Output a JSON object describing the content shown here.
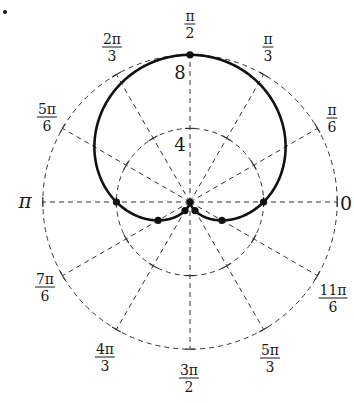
{
  "chart_data": {
    "type": "polar",
    "title": "",
    "equation": "r = 4 + 4 sin θ",
    "curve": "cardioid",
    "radial_ticks": [
      4,
      8
    ],
    "radial_tick_labels": [
      "4",
      "8"
    ],
    "rlim": [
      0,
      8
    ],
    "grid": true,
    "grid_style": "dashed",
    "angle_labels": [
      {
        "angle_deg": 0,
        "num": "0",
        "den": ""
      },
      {
        "angle_deg": 30,
        "num": "π",
        "den": "6"
      },
      {
        "angle_deg": 60,
        "num": "π",
        "den": "3"
      },
      {
        "angle_deg": 90,
        "num": "π",
        "den": "2"
      },
      {
        "angle_deg": 120,
        "num": "2π",
        "den": "3"
      },
      {
        "angle_deg": 150,
        "num": "5π",
        "den": "6"
      },
      {
        "angle_deg": 180,
        "num": "π",
        "den": ""
      },
      {
        "angle_deg": 210,
        "num": "7π",
        "den": "6"
      },
      {
        "angle_deg": 240,
        "num": "4π",
        "den": "3"
      },
      {
        "angle_deg": 270,
        "num": "3π",
        "den": "2"
      },
      {
        "angle_deg": 300,
        "num": "5π",
        "den": "3"
      },
      {
        "angle_deg": 330,
        "num": "11π",
        "den": "6"
      }
    ],
    "marked_points": [
      {
        "theta": "0",
        "r": 4
      },
      {
        "theta": "π/2",
        "r": 8
      },
      {
        "theta": "π",
        "r": 4
      },
      {
        "theta": "7π/6",
        "r": 2
      },
      {
        "theta": "4π/3",
        "r": 0.54
      },
      {
        "theta": "3π/2",
        "r": 0
      },
      {
        "theta": "5π/3",
        "r": 0.54
      },
      {
        "theta": "11π/6",
        "r": 2
      }
    ],
    "colors": {
      "curve": "#111111",
      "grid": "#333333",
      "text": "#1a1a1a"
    }
  },
  "labels": {
    "r4": "4",
    "r8": "8",
    "pi": "π",
    "zero": "0",
    "a30": {
      "num": "π",
      "den": "6"
    },
    "a60": {
      "num": "π",
      "den": "3"
    },
    "a90": {
      "num": "π",
      "den": "2"
    },
    "a120": {
      "num": "2π",
      "den": "3"
    },
    "a150": {
      "num": "5π",
      "den": "6"
    },
    "a210": {
      "num": "7π",
      "den": "6"
    },
    "a240": {
      "num": "4π",
      "den": "3"
    },
    "a270": {
      "num": "3π",
      "den": "2"
    },
    "a300": {
      "num": "5π",
      "den": "3"
    },
    "a330": {
      "num": "11π",
      "den": "6"
    }
  }
}
